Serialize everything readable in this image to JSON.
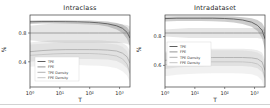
{
  "figure": {
    "kind": "two-panel line figure"
  },
  "chart_data": [
    {
      "type": "line",
      "title": "Intraclass",
      "xlabel": "T",
      "ylabel": "%",
      "x_scale": "log",
      "xlim": [
        0,
        3.35
      ],
      "ylim": [
        0.05,
        1.05
      ],
      "x_ticks": [
        {
          "v": 0,
          "label": "10⁰"
        },
        {
          "v": 1,
          "label": "10¹"
        },
        {
          "v": 2,
          "label": "10²"
        },
        {
          "v": 3,
          "label": "10³"
        }
      ],
      "y_ticks": [
        {
          "v": 0.8,
          "label": "0.8"
        },
        {
          "v": 0.4,
          "label": "0.4"
        }
      ],
      "legend": {
        "position": "lower-left",
        "x": 35,
        "y": 57,
        "w": 44,
        "h": 24
      },
      "series": [
        {
          "name": "TPE",
          "color": "#4d4d4d",
          "band_color": "rgba(90,90,90,0.30)",
          "x": [
            0,
            0.4,
            0.8,
            1.2,
            1.6,
            2.0,
            2.3,
            2.6,
            2.9,
            3.1,
            3.25,
            3.35
          ],
          "y": [
            0.955,
            0.958,
            0.958,
            0.957,
            0.955,
            0.95,
            0.942,
            0.928,
            0.9,
            0.865,
            0.81,
            0.73
          ],
          "band_lo": [
            0.925,
            0.93,
            0.93,
            0.928,
            0.925,
            0.92,
            0.91,
            0.89,
            0.85,
            0.8,
            0.72,
            0.62
          ],
          "band_hi": [
            0.975,
            0.978,
            0.978,
            0.977,
            0.975,
            0.972,
            0.968,
            0.958,
            0.94,
            0.92,
            0.88,
            0.82
          ]
        },
        {
          "name": "FPE",
          "color": "#8a8a8a",
          "band_color": "rgba(140,140,140,0.22)",
          "x": [
            0,
            0.4,
            0.8,
            1.2,
            1.6,
            2.0,
            2.3,
            2.6,
            2.9,
            3.1,
            3.25,
            3.35
          ],
          "y": [
            0.8,
            0.8,
            0.8,
            0.8,
            0.8,
            0.8,
            0.8,
            0.8,
            0.8,
            0.8,
            0.8,
            0.8
          ],
          "band_lo": [
            0.7,
            0.68,
            0.67,
            0.66,
            0.66,
            0.66,
            0.66,
            0.66,
            0.66,
            0.66,
            0.65,
            0.63
          ],
          "band_hi": [
            0.9,
            0.92,
            0.93,
            0.93,
            0.93,
            0.93,
            0.93,
            0.93,
            0.93,
            0.92,
            0.91,
            0.89
          ]
        },
        {
          "name": "TPE Density",
          "color": "#a8a8a8",
          "band_color": "rgba(160,160,160,0.20)",
          "x": [
            0,
            0.4,
            0.8,
            1.2,
            1.6,
            2.0,
            2.3,
            2.6,
            2.9,
            3.1,
            3.25,
            3.35
          ],
          "y": [
            0.54,
            0.555,
            0.565,
            0.57,
            0.57,
            0.57,
            0.568,
            0.562,
            0.55,
            0.52,
            0.47,
            0.38
          ],
          "band_lo": [
            0.4,
            0.42,
            0.43,
            0.44,
            0.44,
            0.44,
            0.435,
            0.43,
            0.41,
            0.37,
            0.31,
            0.22
          ],
          "band_hi": [
            0.67,
            0.69,
            0.7,
            0.7,
            0.7,
            0.7,
            0.7,
            0.69,
            0.68,
            0.66,
            0.62,
            0.55
          ]
        },
        {
          "name": "FPE Density",
          "color": "#bfbfbf",
          "band_color": "rgba(175,175,175,0.18)",
          "x": [
            0,
            0.4,
            0.8,
            1.2,
            1.6,
            2.0,
            2.3,
            2.6,
            2.9,
            3.1,
            3.25,
            3.35
          ],
          "y": [
            0.49,
            0.5,
            0.51,
            0.515,
            0.515,
            0.515,
            0.51,
            0.5,
            0.48,
            0.44,
            0.37,
            0.24
          ],
          "band_lo": [
            0.33,
            0.34,
            0.35,
            0.355,
            0.355,
            0.35,
            0.345,
            0.335,
            0.31,
            0.27,
            0.21,
            0.12
          ],
          "band_hi": [
            0.64,
            0.65,
            0.66,
            0.665,
            0.665,
            0.665,
            0.66,
            0.655,
            0.64,
            0.61,
            0.55,
            0.43
          ]
        }
      ]
    },
    {
      "type": "line",
      "title": "Intradataset",
      "xlabel": "T",
      "ylabel": "%",
      "x_scale": "log",
      "xlim": [
        0,
        3.35
      ],
      "ylim": [
        0.45,
        0.95
      ],
      "x_ticks": [
        {
          "v": 0,
          "label": "10⁰"
        },
        {
          "v": 1,
          "label": "10¹"
        },
        {
          "v": 2,
          "label": "10²"
        },
        {
          "v": 3,
          "label": "10³"
        }
      ],
      "y_ticks": [
        {
          "v": 0.8,
          "label": "0.8"
        },
        {
          "v": 0.6,
          "label": "0.6"
        }
      ],
      "legend": {
        "position": "center-left",
        "x": 32,
        "y": 42,
        "w": 44,
        "h": 24
      },
      "series": [
        {
          "name": "TPE",
          "color": "#4d4d4d",
          "band_color": "rgba(90,90,90,0.30)",
          "x": [
            0,
            0.4,
            0.8,
            1.2,
            1.6,
            2.0,
            2.3,
            2.6,
            2.9,
            3.1,
            3.25,
            3.35
          ],
          "y": [
            0.925,
            0.928,
            0.928,
            0.928,
            0.928,
            0.926,
            0.922,
            0.915,
            0.9,
            0.878,
            0.845,
            0.785
          ],
          "band_lo": [
            0.905,
            0.908,
            0.908,
            0.908,
            0.906,
            0.903,
            0.898,
            0.888,
            0.868,
            0.838,
            0.79,
            0.71
          ],
          "band_hi": [
            0.94,
            0.942,
            0.942,
            0.942,
            0.942,
            0.941,
            0.939,
            0.935,
            0.928,
            0.915,
            0.895,
            0.86
          ]
        },
        {
          "name": "FPE",
          "color": "#8a8a8a",
          "band_color": "rgba(140,140,140,0.22)",
          "x": [
            0,
            0.4,
            0.8,
            1.2,
            1.6,
            2.0,
            2.3,
            2.6,
            2.9,
            3.1,
            3.25,
            3.35
          ],
          "y": [
            0.825,
            0.825,
            0.825,
            0.825,
            0.825,
            0.825,
            0.825,
            0.825,
            0.825,
            0.825,
            0.825,
            0.825
          ],
          "band_lo": [
            0.8,
            0.795,
            0.79,
            0.79,
            0.79,
            0.79,
            0.79,
            0.79,
            0.79,
            0.79,
            0.785,
            0.78
          ],
          "band_hi": [
            0.85,
            0.855,
            0.86,
            0.86,
            0.86,
            0.86,
            0.86,
            0.86,
            0.86,
            0.86,
            0.855,
            0.85
          ]
        },
        {
          "name": "TPE Density",
          "color": "#a8a8a8",
          "band_color": "rgba(160,160,160,0.20)",
          "x": [
            0,
            0.4,
            0.8,
            1.2,
            1.6,
            2.0,
            2.3,
            2.6,
            2.9,
            3.1,
            3.25,
            3.35
          ],
          "y": [
            0.635,
            0.645,
            0.65,
            0.653,
            0.655,
            0.655,
            0.655,
            0.655,
            0.652,
            0.645,
            0.625,
            0.565
          ],
          "band_lo": [
            0.575,
            0.585,
            0.59,
            0.593,
            0.595,
            0.595,
            0.595,
            0.595,
            0.59,
            0.58,
            0.555,
            0.49
          ],
          "band_hi": [
            0.695,
            0.705,
            0.71,
            0.713,
            0.715,
            0.715,
            0.715,
            0.715,
            0.712,
            0.705,
            0.69,
            0.64
          ]
        },
        {
          "name": "FPE Density",
          "color": "#bfbfbf",
          "band_color": "rgba(175,175,175,0.18)",
          "x": [
            0,
            0.4,
            0.8,
            1.2,
            1.6,
            2.0,
            2.3,
            2.6,
            2.9,
            3.1,
            3.25,
            3.35
          ],
          "y": [
            0.605,
            0.615,
            0.62,
            0.623,
            0.625,
            0.625,
            0.625,
            0.624,
            0.62,
            0.61,
            0.585,
            0.515
          ],
          "band_lo": [
            0.525,
            0.535,
            0.54,
            0.543,
            0.545,
            0.545,
            0.545,
            0.543,
            0.538,
            0.525,
            0.495,
            0.42
          ],
          "band_hi": [
            0.685,
            0.695,
            0.7,
            0.703,
            0.705,
            0.705,
            0.705,
            0.703,
            0.698,
            0.69,
            0.67,
            0.6
          ]
        }
      ]
    }
  ]
}
